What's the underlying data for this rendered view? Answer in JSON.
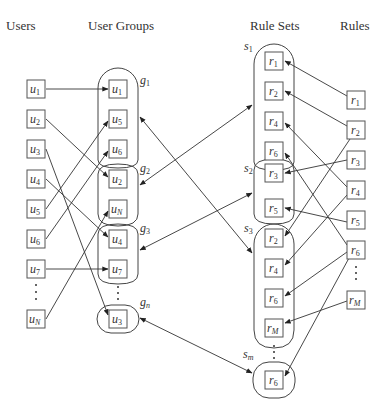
{
  "headers": {
    "users": "Users",
    "user_groups": "User Groups",
    "rule_sets": "Rule Sets",
    "rules": "Rules"
  },
  "users": [
    {
      "id": "u1",
      "base": "u",
      "sub": "1",
      "y": 89
    },
    {
      "id": "u2",
      "base": "u",
      "sub": "2",
      "y": 119
    },
    {
      "id": "u3",
      "base": "u",
      "sub": "3",
      "y": 149
    },
    {
      "id": "u4",
      "base": "u",
      "sub": "4",
      "y": 179
    },
    {
      "id": "u5",
      "base": "u",
      "sub": "5",
      "y": 209
    },
    {
      "id": "u6",
      "base": "u",
      "sub": "6",
      "y": 239
    },
    {
      "id": "u7",
      "base": "u",
      "sub": "7",
      "y": 269
    },
    {
      "id": "uN",
      "base": "u",
      "sub": "N",
      "y": 319
    }
  ],
  "user_groups": [
    {
      "label": "g",
      "sub": "1",
      "members": [
        {
          "base": "u",
          "sub": "1",
          "y": 89
        },
        {
          "base": "u",
          "sub": "5",
          "y": 119
        },
        {
          "base": "u",
          "sub": "6",
          "y": 149
        }
      ]
    },
    {
      "label": "g",
      "sub": "2",
      "members": [
        {
          "base": "u",
          "sub": "2",
          "y": 179
        },
        {
          "base": "u",
          "sub": "N",
          "y": 209
        }
      ]
    },
    {
      "label": "g",
      "sub": "3",
      "members": [
        {
          "base": "u",
          "sub": "4",
          "y": 239
        },
        {
          "base": "u",
          "sub": "7",
          "y": 269
        }
      ]
    },
    {
      "label": "g",
      "sub": "n",
      "members": [
        {
          "base": "u",
          "sub": "3",
          "y": 319
        }
      ]
    }
  ],
  "rule_sets": [
    {
      "label": "s",
      "sub": "1",
      "members": [
        {
          "base": "r",
          "sub": "1",
          "y": 61
        },
        {
          "base": "r",
          "sub": "2",
          "y": 91
        },
        {
          "base": "r",
          "sub": "4",
          "y": 121
        },
        {
          "base": "r",
          "sub": "6",
          "y": 151
        }
      ]
    },
    {
      "label": "s",
      "sub": "2",
      "members": [
        {
          "base": "r",
          "sub": "3",
          "y": 173
        },
        {
          "base": "r",
          "sub": "5",
          "y": 208
        }
      ]
    },
    {
      "label": "s",
      "sub": "3",
      "members": [
        {
          "base": "r",
          "sub": "2",
          "y": 238
        },
        {
          "base": "r",
          "sub": "4",
          "y": 268
        },
        {
          "base": "r",
          "sub": "6",
          "y": 298
        },
        {
          "base": "r",
          "sub": "M",
          "y": 328
        }
      ]
    },
    {
      "label": "s",
      "sub": "m",
      "members": [
        {
          "base": "r",
          "sub": "6",
          "y": 380
        }
      ]
    }
  ],
  "rules": [
    {
      "id": "r1",
      "base": "r",
      "sub": "1",
      "y": 100
    },
    {
      "id": "r2",
      "base": "r",
      "sub": "2",
      "y": 130
    },
    {
      "id": "r3",
      "base": "r",
      "sub": "3",
      "y": 160
    },
    {
      "id": "r4",
      "base": "r",
      "sub": "4",
      "y": 190
    },
    {
      "id": "r5",
      "base": "r",
      "sub": "5",
      "y": 220
    },
    {
      "id": "r6",
      "base": "r",
      "sub": "6",
      "y": 250
    },
    {
      "id": "rM",
      "base": "r",
      "sub": "M",
      "y": 300
    }
  ],
  "user_to_group_edges": [
    {
      "from": "u1",
      "to": "g1.u1"
    },
    {
      "from": "u2",
      "to": "g2.u2"
    },
    {
      "from": "u3",
      "to": "gn.u3"
    },
    {
      "from": "u4",
      "to": "g3.u4"
    },
    {
      "from": "u5",
      "to": "g1.u5"
    },
    {
      "from": "u6",
      "to": "g1.u6"
    },
    {
      "from": "u7",
      "to": "g3.u7"
    },
    {
      "from": "uN",
      "to": "g2.uN"
    }
  ],
  "group_ruleset_edges": [
    {
      "from": "g1",
      "to": "s3",
      "bidirectional": true
    },
    {
      "from": "g2",
      "to": "s1",
      "bidirectional": true
    },
    {
      "from": "g3",
      "to": "s2",
      "bidirectional": true
    },
    {
      "from": "gn",
      "to": "sm",
      "bidirectional": true
    }
  ],
  "rule_to_ruleset_edges": [
    {
      "from": "r1",
      "to": "s1.r1"
    },
    {
      "from": "r2",
      "to": "s1.r2"
    },
    {
      "from": "r2",
      "to": "s3.r2"
    },
    {
      "from": "r3",
      "to": "s2.r3"
    },
    {
      "from": "r4",
      "to": "s1.r4"
    },
    {
      "from": "r4",
      "to": "s3.r4"
    },
    {
      "from": "r5",
      "to": "s2.r5"
    },
    {
      "from": "r6",
      "to": "s1.r6"
    },
    {
      "from": "r6",
      "to": "s3.r6"
    },
    {
      "from": "r6",
      "to": "sm.r6"
    },
    {
      "from": "rM",
      "to": "s3.rM"
    }
  ]
}
